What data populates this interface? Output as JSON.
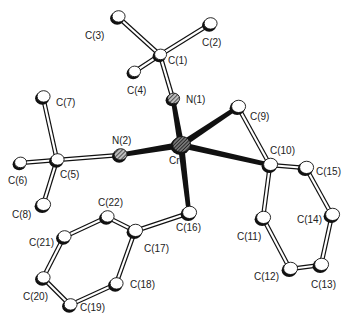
{
  "diagram": {
    "type": "ORTEP molecular structure",
    "metal": "Cr",
    "colors": {
      "bond_metal": "#111111",
      "bond_organic_fill": "#ffffff",
      "bond_outline": "#111111",
      "atom_c_fill": "#ffffff",
      "atom_n_fill": "#555555",
      "atom_cr_fill": "#333333"
    },
    "atoms": [
      {
        "id": "C3",
        "label": "C(3)",
        "el": "C",
        "x": 118,
        "y": 17,
        "r": 6.5,
        "lx": 85,
        "ly": 39
      },
      {
        "id": "C2",
        "label": "C(2)",
        "el": "C",
        "x": 210,
        "y": 24,
        "r": 6.5,
        "lx": 202,
        "ly": 46
      },
      {
        "id": "C1",
        "label": "C(1)",
        "el": "C",
        "x": 160,
        "y": 55,
        "r": 6,
        "lx": 168,
        "ly": 64
      },
      {
        "id": "C4",
        "label": "C(4)",
        "el": "C",
        "x": 134,
        "y": 72,
        "r": 6,
        "lx": 127,
        "ly": 94
      },
      {
        "id": "N1",
        "label": "N(1)",
        "el": "N",
        "x": 173,
        "y": 99,
        "r": 6,
        "lx": 186,
        "ly": 103
      },
      {
        "id": "C7",
        "label": "C(7)",
        "el": "C",
        "x": 43,
        "y": 97,
        "r": 6.5,
        "lx": 56,
        "ly": 106
      },
      {
        "id": "C5",
        "label": "C(5)",
        "el": "C",
        "x": 57,
        "y": 160,
        "r": 6.5,
        "lx": 60,
        "ly": 178
      },
      {
        "id": "C6",
        "label": "C(6)",
        "el": "C",
        "x": 20,
        "y": 163,
        "r": 6,
        "lx": 8,
        "ly": 184
      },
      {
        "id": "C8",
        "label": "C(8)",
        "el": "C",
        "x": 43,
        "y": 205,
        "r": 7,
        "lx": 12,
        "ly": 218
      },
      {
        "id": "N2",
        "label": "N(2)",
        "el": "N",
        "x": 120,
        "y": 155,
        "r": 6.5,
        "lx": 112,
        "ly": 144
      },
      {
        "id": "Cr",
        "label": "Cr",
        "el": "Cr",
        "x": 181,
        "y": 145,
        "r": 9,
        "lx": 169,
        "ly": 164
      },
      {
        "id": "C9",
        "label": "C(9)",
        "el": "C",
        "x": 238,
        "y": 107,
        "r": 7,
        "lx": 250,
        "ly": 120
      },
      {
        "id": "C10",
        "label": "C(10)",
        "el": "C",
        "x": 270,
        "y": 165,
        "r": 7,
        "lx": 270,
        "ly": 154
      },
      {
        "id": "C15",
        "label": "C(15)",
        "el": "C",
        "x": 306,
        "y": 168,
        "r": 7,
        "lx": 316,
        "ly": 175
      },
      {
        "id": "C14",
        "label": "C(14)",
        "el": "C",
        "x": 332,
        "y": 215,
        "r": 7,
        "lx": 297,
        "ly": 223
      },
      {
        "id": "C13",
        "label": "C(13)",
        "el": "C",
        "x": 321,
        "y": 265,
        "r": 7,
        "lx": 311,
        "ly": 288
      },
      {
        "id": "C12",
        "label": "C(12)",
        "el": "C",
        "x": 290,
        "y": 269,
        "r": 7,
        "lx": 254,
        "ly": 280
      },
      {
        "id": "C11",
        "label": "C(11)",
        "el": "C",
        "x": 263,
        "y": 218,
        "r": 7,
        "lx": 237,
        "ly": 240
      },
      {
        "id": "C16",
        "label": "C(16)",
        "el": "C",
        "x": 189,
        "y": 213,
        "r": 7,
        "lx": 176,
        "ly": 231
      },
      {
        "id": "C17",
        "label": "C(17)",
        "el": "C",
        "x": 135,
        "y": 231,
        "r": 7,
        "lx": 144,
        "ly": 252
      },
      {
        "id": "C22",
        "label": "C(22)",
        "el": "C",
        "x": 107,
        "y": 217,
        "r": 6.5,
        "lx": 98,
        "ly": 206
      },
      {
        "id": "C21",
        "label": "C(21)",
        "el": "C",
        "x": 64,
        "y": 237,
        "r": 6.5,
        "lx": 29,
        "ly": 246
      },
      {
        "id": "C20",
        "label": "C(20)",
        "el": "C",
        "x": 43,
        "y": 278,
        "r": 6.5,
        "lx": 23,
        "ly": 300
      },
      {
        "id": "C19",
        "label": "C(19)",
        "el": "C",
        "x": 70,
        "y": 305,
        "r": 6.5,
        "lx": 80,
        "ly": 311
      },
      {
        "id": "C18",
        "label": "C(18)",
        "el": "C",
        "x": 116,
        "y": 284,
        "r": 6.5,
        "lx": 130,
        "ly": 288
      }
    ],
    "bonds": [
      {
        "a": "C1",
        "b": "C3",
        "kind": "organic"
      },
      {
        "a": "C1",
        "b": "C2",
        "kind": "organic"
      },
      {
        "a": "C1",
        "b": "C4",
        "kind": "organic"
      },
      {
        "a": "C1",
        "b": "N1",
        "kind": "organic"
      },
      {
        "a": "N1",
        "b": "Cr",
        "kind": "metal"
      },
      {
        "a": "C5",
        "b": "C7",
        "kind": "organic"
      },
      {
        "a": "C5",
        "b": "C6",
        "kind": "organic"
      },
      {
        "a": "C5",
        "b": "C8",
        "kind": "organic"
      },
      {
        "a": "C5",
        "b": "N2",
        "kind": "organic"
      },
      {
        "a": "N2",
        "b": "Cr",
        "kind": "metal"
      },
      {
        "a": "Cr",
        "b": "C9",
        "kind": "metal"
      },
      {
        "a": "Cr",
        "b": "C10",
        "kind": "metal"
      },
      {
        "a": "Cr",
        "b": "C16",
        "kind": "metal"
      },
      {
        "a": "C9",
        "b": "C10",
        "kind": "organic"
      },
      {
        "a": "C10",
        "b": "C15",
        "kind": "organic"
      },
      {
        "a": "C10",
        "b": "C11",
        "kind": "organic"
      },
      {
        "a": "C15",
        "b": "C14",
        "kind": "organic"
      },
      {
        "a": "C14",
        "b": "C13",
        "kind": "organic"
      },
      {
        "a": "C13",
        "b": "C12",
        "kind": "organic"
      },
      {
        "a": "C12",
        "b": "C11",
        "kind": "organic"
      },
      {
        "a": "C16",
        "b": "C17",
        "kind": "organic"
      },
      {
        "a": "C17",
        "b": "C22",
        "kind": "organic"
      },
      {
        "a": "C22",
        "b": "C21",
        "kind": "organic"
      },
      {
        "a": "C21",
        "b": "C20",
        "kind": "organic"
      },
      {
        "a": "C20",
        "b": "C19",
        "kind": "organic"
      },
      {
        "a": "C19",
        "b": "C18",
        "kind": "organic"
      },
      {
        "a": "C18",
        "b": "C17",
        "kind": "organic"
      }
    ]
  }
}
